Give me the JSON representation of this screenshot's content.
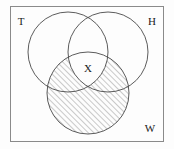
{
  "figure": {
    "kind": "venn-diagram",
    "set_count": 3,
    "background_color": "#fdfdfd",
    "stroke_color": "#4a4a4a",
    "hatch_color": "#6a6a6a",
    "label_color": "#1a1a1a",
    "frame": {
      "name": "universe-rectangle",
      "x": 10,
      "y": 6,
      "width": 154,
      "height": 136,
      "stroke": "#8a8a8a"
    },
    "circles": [
      {
        "id": "T",
        "label": "T",
        "cx": 68,
        "cy": 52,
        "r": 40,
        "label_x": 21,
        "label_y": 22
      },
      {
        "id": "H",
        "label": "H",
        "cx": 108,
        "cy": 52,
        "r": 40,
        "label_x": 152,
        "label_y": 22
      },
      {
        "id": "W",
        "label": "W",
        "cx": 88,
        "cy": 93,
        "r": 41,
        "label_x": 150,
        "label_y": 129
      }
    ],
    "region_labels": [
      {
        "id": "X",
        "label": "X",
        "x": 88,
        "y": 69,
        "description": "central triple intersection"
      }
    ],
    "shading": {
      "name": "hatch-fill",
      "pattern": "diagonal-lines",
      "angle_degrees": 45,
      "spacing_px": 4,
      "applies_to": "W",
      "excludes": "X"
    }
  }
}
